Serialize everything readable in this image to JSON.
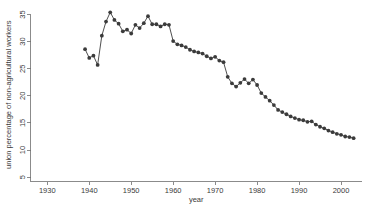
{
  "chart_data": {
    "type": "line",
    "title": "",
    "subtitle": "",
    "xlabel": "year",
    "ylabel": "union percentage of non-agricultural workers",
    "xlim": [
      1926,
      2005
    ],
    "ylim": [
      4.2,
      36.2
    ],
    "xticks": [
      1930,
      1940,
      1950,
      1960,
      1970,
      1980,
      1990,
      2000
    ],
    "yticks": [
      5,
      10,
      15,
      20,
      25,
      30,
      35
    ],
    "xtick_labels": [
      "1930",
      "1940",
      "1950",
      "1960",
      "1970",
      "1980",
      "1990",
      "2000"
    ],
    "ytick_labels": [
      "5",
      "10",
      "15",
      "20",
      "25",
      "30",
      "35"
    ],
    "grid": false,
    "legend": null,
    "legend_position": "none",
    "marker": "circle",
    "marker_color": "#3b3b3b",
    "line_color": "#3b3b3b",
    "x": [
      1939,
      1940,
      1941,
      1942,
      1943,
      1944,
      1945,
      1946,
      1947,
      1948,
      1949,
      1950,
      1951,
      1952,
      1953,
      1954,
      1955,
      1956,
      1957,
      1958,
      1959,
      1960,
      1961,
      1962,
      1963,
      1964,
      1965,
      1966,
      1967,
      1968,
      1969,
      1970,
      1971,
      1972,
      1973,
      1974,
      1975,
      1976,
      1977,
      1978,
      1979,
      1980,
      1981,
      1982,
      1983,
      1984,
      1985,
      1986,
      1987,
      1988,
      1989,
      1990,
      1991,
      1992,
      1993,
      1994,
      1995,
      1996,
      1997,
      1998,
      1999,
      2000,
      2001,
      2002,
      2003
    ],
    "y": [
      28.6,
      27.0,
      27.4,
      25.7,
      31.1,
      33.7,
      35.4,
      34.0,
      33.3,
      31.9,
      32.2,
      31.5,
      33.1,
      32.5,
      33.4,
      34.7,
      33.2,
      33.2,
      32.8,
      33.2,
      33.1,
      30.1,
      29.5,
      29.3,
      29.0,
      28.5,
      28.2,
      28.0,
      27.8,
      27.3,
      26.9,
      27.2,
      26.5,
      26.2,
      23.5,
      22.3,
      21.7,
      22.4,
      23.1,
      22.3,
      23.0,
      22.0,
      20.5,
      19.8,
      19.1,
      18.3,
      17.4,
      17.0,
      16.6,
      16.2,
      15.9,
      15.6,
      15.5,
      15.2,
      15.3,
      14.7,
      14.3,
      14.0,
      13.6,
      13.3,
      13.0,
      12.8,
      12.5,
      12.4,
      12.2
    ],
    "n_points": 65,
    "y_min_value": 12.2,
    "y_max_value": 35.4,
    "y_min_year": 2003,
    "y_max_year": 1945
  }
}
